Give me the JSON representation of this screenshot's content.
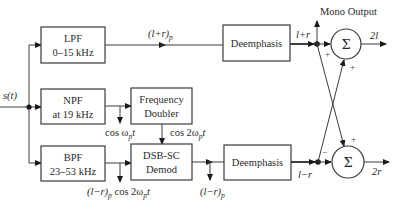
{
  "diagram": {
    "input": {
      "label": "s(t)"
    },
    "blocks": {
      "lpf": {
        "line1": "LPF",
        "line2": "0–15 kHz"
      },
      "npf": {
        "line1": "NPF",
        "line2": "at 19 kHz"
      },
      "bpf": {
        "line1": "BPF",
        "line2": "23–53 kHz"
      },
      "doubler": {
        "line1": "Frequency",
        "line2": "Doubler"
      },
      "demod": {
        "line1": "DSB-SC",
        "line2": "Demod"
      },
      "deemph_top": {
        "label": "Deemphasis"
      },
      "deemph_bottom": {
        "label": "Deemphasis"
      },
      "sum_top": {
        "symbol": "Σ"
      },
      "sum_bottom": {
        "symbol": "Σ"
      }
    },
    "signals": {
      "lpf_out": {
        "base": "(l+r)",
        "sub": "p"
      },
      "npf_out": {
        "base": "cos ω",
        "sub": "p",
        "tail": "t"
      },
      "doubler_out": {
        "base": "cos 2ω",
        "sub": "p",
        "tail": "t"
      },
      "bpf_out": {
        "base": "(l−r)",
        "sub": "p",
        "mid": " cos 2ω",
        "sub2": "p",
        "tail": "t"
      },
      "demod_out": {
        "base": "(l−r)",
        "sub": "p"
      },
      "deemph_top_out": "l+r",
      "deemph_bottom_out": "l−r",
      "sum_top_out": "2l",
      "sum_bottom_out": "2r",
      "mono_output": "Mono Output"
    },
    "signs": {
      "top_left": "+",
      "top_bottom": "+",
      "bottom_left": "−",
      "bottom_top": "+"
    }
  }
}
